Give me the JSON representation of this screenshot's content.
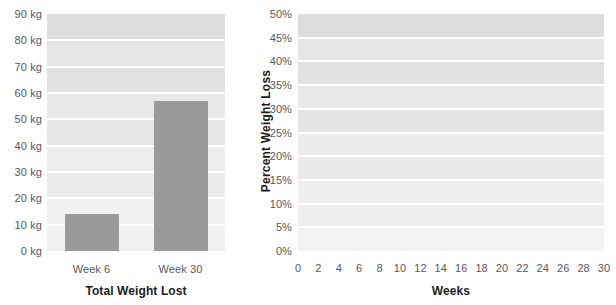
{
  "chart_data": [
    {
      "type": "bar",
      "title": "Total Weight Lost",
      "xlabel": "Total Weight Lost",
      "ylabel": "",
      "categories": [
        "Week 6",
        "Week 30"
      ],
      "values": [
        14,
        57
      ],
      "unit": "kg",
      "ylim": [
        0,
        90
      ],
      "ytick_values": [
        0,
        10,
        20,
        30,
        40,
        50,
        60,
        70,
        80,
        90
      ],
      "ytick_labels": [
        "0 kg",
        "10 kg",
        "20 kg",
        "30 kg",
        "40 kg",
        "50 kg",
        "60 kg",
        "70 kg",
        "80 kg",
        "90 kg"
      ],
      "grid": true,
      "grid_style": "alternating-horizontal-bands",
      "legend": "none",
      "bar_color": "#9a9a9a",
      "band_color": "#dcdcdc",
      "gridline_color": "#ffffff"
    },
    {
      "type": "line",
      "title": "Percent Weight Loss",
      "xlabel": "Weeks",
      "ylabel": "Percent Weight Loss",
      "ylim": [
        0,
        50
      ],
      "xlim": [
        0,
        30
      ],
      "ytick_values": [
        0,
        5,
        10,
        15,
        20,
        25,
        30,
        35,
        40,
        45,
        50
      ],
      "ytick_labels": [
        "0%",
        "5%",
        "10%",
        "15%",
        "20%",
        "25%",
        "30%",
        "35%",
        "40%",
        "45%",
        "50%"
      ],
      "xtick_values": [
        0,
        2,
        4,
        6,
        8,
        10,
        12,
        14,
        16,
        18,
        20,
        22,
        24,
        26,
        28,
        30
      ],
      "xtick_labels": [
        "0",
        "2",
        "4",
        "6",
        "8",
        "10",
        "12",
        "14",
        "16",
        "18",
        "20",
        "22",
        "24",
        "26",
        "28",
        "30"
      ],
      "grid": true,
      "grid_style": "alternating-horizontal-bands",
      "legend": "none",
      "line_color": "#9a9a9a",
      "marker_color": "#9a9a9a",
      "band_color": "#dcdcdc",
      "gridline_color": "#ffffff",
      "x": [
        0,
        1,
        2,
        3,
        4,
        5,
        6,
        7,
        8,
        9,
        10,
        11,
        12,
        13,
        14,
        30
      ],
      "y": [
        0,
        2.3,
        3.2,
        5.8,
        7.8,
        9.0,
        12.0,
        13.6,
        14.4,
        16.6,
        18.5,
        22.3,
        24.2,
        25.4,
        28.0,
        38.5
      ],
      "series": [
        {
          "name": "Percent Weight Loss",
          "values": [
            0,
            2.3,
            3.2,
            5.8,
            7.8,
            9.0,
            12.0,
            13.6,
            14.4,
            16.6,
            18.5,
            22.3,
            24.2,
            25.4,
            28.0,
            38.5
          ]
        }
      ]
    }
  ],
  "left_chart": {
    "axis_title": "Total Weight Lost",
    "ytick_labels": [
      "90 kg",
      "80 kg",
      "70 kg",
      "60 kg",
      "50 kg",
      "40 kg",
      "30 kg",
      "20 kg",
      "10 kg",
      "0 kg"
    ],
    "category_labels": [
      "Week 6",
      "Week 30"
    ]
  },
  "right_chart": {
    "axis_title_x": "Weeks",
    "axis_title_y": "Percent Weight Loss",
    "ytick_labels": [
      "50%",
      "45%",
      "40%",
      "35%",
      "30%",
      "25%",
      "20%",
      "15%",
      "10%",
      "5%",
      "0%"
    ],
    "xtick_labels": [
      "0",
      "2",
      "4",
      "6",
      "8",
      "10",
      "12",
      "14",
      "16",
      "18",
      "20",
      "22",
      "24",
      "26",
      "28",
      "30"
    ]
  },
  "colors": {
    "bar": "#9a9a9a",
    "line": "#9a9a9a",
    "band": "#dcdcdc",
    "gridline": "#ffffff",
    "tick_text": "#58585a",
    "title_text": "#1c1c1c"
  }
}
